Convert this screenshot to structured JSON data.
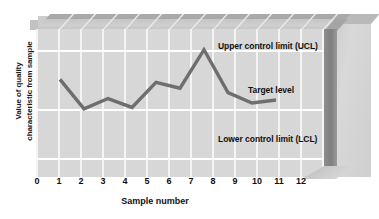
{
  "axes": {
    "y_title_line1": "Value of quality",
    "y_title_line2": "characteristic from sample",
    "x_title": "Sample number",
    "x_ticks": [
      "0",
      "1",
      "2",
      "3",
      "4",
      "5",
      "6",
      "7",
      "8",
      "9",
      "10",
      "11",
      "12"
    ]
  },
  "annotations": {
    "ucl": "Upper control limit (UCL)",
    "target": "Target level",
    "lcl": "Lower control limit (LCL)"
  },
  "colors": {
    "plot_background": "#d7d7d7",
    "gridline": "#f4f4f4",
    "control_line": "#ffffff",
    "series_line": "#6e6e6e",
    "block_top": "#c4c4c4",
    "block_side": "#8a8a8a",
    "text": "#111111"
  },
  "chart_data": {
    "type": "line",
    "title": "",
    "subtitle": "",
    "xlabel": "Sample number",
    "ylabel": "Value of quality characteristic from sample",
    "xlim": [
      0,
      12
    ],
    "ylim": [
      0,
      10
    ],
    "grid": true,
    "legend": null,
    "x": [
      1,
      2,
      3,
      4,
      5,
      6,
      7,
      8,
      9,
      10
    ],
    "series": [
      {
        "name": "Sample quality characteristic",
        "values": [
          6.6,
          4.6,
          5.3,
          4.7,
          6.4,
          6.0,
          8.6,
          5.7,
          5.0,
          5.2
        ],
        "color": "#6e6e6e",
        "marker": "none",
        "linewidth": 3
      }
    ],
    "reference_lines": [
      {
        "label": "Upper control limit (UCL)",
        "value": 9.4,
        "color": "#ffffff"
      },
      {
        "label": "Target level",
        "value": 5.4,
        "color": "#ffffff"
      },
      {
        "label": "Lower control limit (LCL)",
        "value": 2.1,
        "color": "#ffffff"
      }
    ],
    "x_tick_labels": [
      "0",
      "1",
      "2",
      "3",
      "4",
      "5",
      "6",
      "7",
      "8",
      "9",
      "10",
      "11",
      "12"
    ],
    "y_tick_labels": []
  }
}
